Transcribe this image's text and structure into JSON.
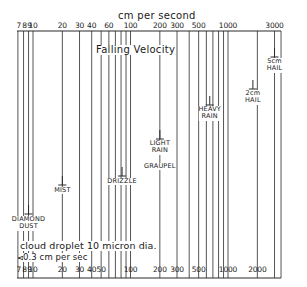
{
  "title": "Falling Velocity",
  "axis": {
    "unit_label": "cm per second",
    "top_ticks": [
      "7",
      "8",
      "9",
      "10",
      "20",
      "30",
      "40",
      "60",
      "100",
      "200",
      "300",
      "500",
      "1000",
      "3000"
    ],
    "bottom_ticks": [
      "7",
      "8",
      "9",
      "10",
      "20",
      "30",
      "40",
      "50",
      "100",
      "200",
      "300",
      "500",
      "1000",
      "2000"
    ],
    "scale": "log",
    "range": [
      7,
      3500
    ]
  },
  "categories": [
    {
      "label_lines": [
        "DIAMOND",
        "DUST"
      ],
      "velocity_cm_s": 9
    },
    {
      "label_lines": [
        "MIST"
      ],
      "velocity_cm_s": 20
    },
    {
      "label_lines": [
        "DRIZZLE"
      ],
      "velocity_cm_s": 80
    },
    {
      "label_lines": [
        "LIGHT",
        "RAIN"
      ],
      "velocity_cm_s": 200
    },
    {
      "label_lines": [
        "GRAUPEL"
      ],
      "velocity_cm_s": 200
    },
    {
      "label_lines": [
        "HEAVY",
        "RAIN"
      ],
      "velocity_cm_s": 650
    },
    {
      "label_lines": [
        "2cm",
        "HAIL"
      ],
      "velocity_cm_s": 1800
    },
    {
      "label_lines": [
        "5cm",
        "HAIL"
      ],
      "velocity_cm_s": 3000
    }
  ],
  "annotation": {
    "line1": "cloud droplet 10 micron dia.",
    "line2": "0.3 cm per sec"
  },
  "chart_data": {
    "type": "diagram",
    "title": "Falling Velocity",
    "xlabel": "cm per second",
    "x_scale": "log",
    "xlim": [
      7,
      3500
    ],
    "grid_values": [
      7,
      8,
      9,
      10,
      20,
      30,
      40,
      50,
      60,
      70,
      80,
      90,
      100,
      200,
      300,
      400,
      500,
      600,
      700,
      800,
      900,
      1000,
      2000,
      3000
    ],
    "markers": [
      {
        "name": "cloud droplet 10 micron dia.",
        "value": 0.3,
        "note": "off-scale left, arrow"
      },
      {
        "name": "Diamond Dust",
        "value": 9
      },
      {
        "name": "Mist",
        "value": 20
      },
      {
        "name": "Drizzle",
        "value": 80
      },
      {
        "name": "Light Rain / Graupel",
        "value": 200
      },
      {
        "name": "Heavy Rain",
        "value": 650
      },
      {
        "name": "2cm Hail",
        "value": 1800
      },
      {
        "name": "5cm Hail",
        "value": 3000
      }
    ]
  }
}
